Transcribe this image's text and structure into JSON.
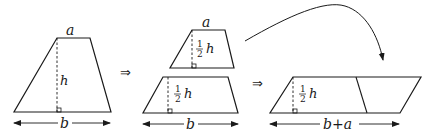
{
  "diagram": {
    "colors": {
      "stroke": "#1a1a1a",
      "background": "#ffffff"
    },
    "step1": {
      "shape": "trapezoid",
      "top_label": "a",
      "height_label": "h",
      "base_label": "b"
    },
    "implies_1": "⇒",
    "step2": {
      "top_piece": {
        "top_label": "a",
        "height_frac_num": "1",
        "height_frac_den": "2",
        "height_var": "h"
      },
      "bottom_piece": {
        "height_frac_num": "1",
        "height_frac_den": "2",
        "height_var": "h"
      },
      "base_label": "b"
    },
    "implies_2": "⇒",
    "step3": {
      "shape": "parallelogram",
      "height_frac_num": "1",
      "height_frac_den": "2",
      "height_var": "h",
      "base_label": "b+a"
    },
    "move_arrow": "curved-arrow"
  }
}
